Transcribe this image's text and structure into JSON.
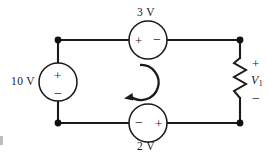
{
  "figure": {
    "type": "electrical-circuit-schematic",
    "width": 267,
    "height": 159,
    "background_color": "#ffffff",
    "line_color": "#1a1a1a"
  },
  "sources": {
    "left": {
      "name": "source-10v",
      "value_label": "10 V",
      "plus_sign": "+",
      "minus_sign": "−",
      "polarity": "plus-top",
      "orientation": "vertical",
      "label_position": "left"
    },
    "top": {
      "name": "source-3v",
      "value_label": "3 V",
      "plus_sign": "+",
      "minus_sign": "−",
      "polarity": "plus-left",
      "orientation": "horizontal",
      "label_position": "above"
    },
    "bottom": {
      "name": "source-2v",
      "value_label": "2 V",
      "plus_sign": "+",
      "minus_sign": "−",
      "polarity": "minus-left",
      "orientation": "horizontal",
      "label_position": "below"
    }
  },
  "resistor": {
    "name": "resistor-v1",
    "voltage_label": "V",
    "voltage_subscript": "1",
    "plus_sign": "+",
    "minus_sign": "−",
    "polarity": "plus-top",
    "orientation": "vertical"
  },
  "mesh_current": {
    "name": "mesh-current-arrow",
    "direction": "clockwise",
    "label": ""
  },
  "nodes": [
    {
      "name": "node-top-left"
    },
    {
      "name": "node-top-right"
    },
    {
      "name": "node-bottom-left"
    },
    {
      "name": "node-bottom-right"
    }
  ]
}
